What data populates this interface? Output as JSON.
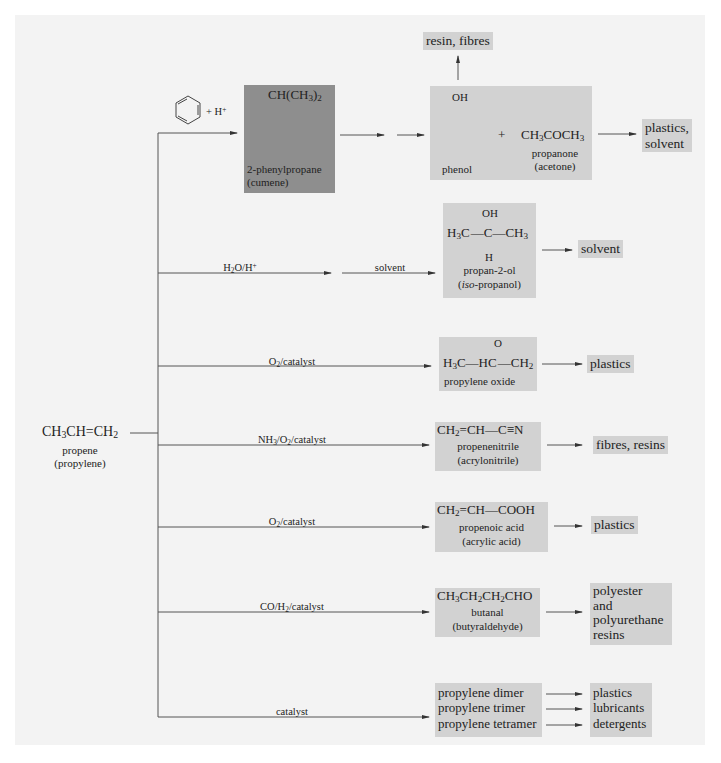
{
  "figure": {
    "start": {
      "formula": "CH3CH=CH2",
      "formula_parts": [
        "CH",
        "3",
        "CH",
        "=",
        "CH",
        "2"
      ],
      "name": "propene",
      "alt_name": "(propylene)"
    },
    "branches": [
      {
        "id": "cumene",
        "reagent": "+ H+",
        "reagent_icon": "benzene-ring-icon",
        "intermediate": {
          "formula": "CH(CH3)2",
          "name": "2-phenylpropane",
          "alt_name": "(cumene)"
        },
        "products": [
          {
            "formula": "OH",
            "name": "phenol"
          },
          {
            "formula": "CH3COCH3",
            "name": "propanone",
            "alt_name": "(acetone)"
          }
        ],
        "plus": "+",
        "uses": [
          "resin, fibres",
          "plastics, solvent"
        ],
        "uses_display": {
          "up": "resin, fibres",
          "right_line1": "plastics,",
          "right_line2": "solvent"
        }
      },
      {
        "id": "isopropanol",
        "condition": "H2O/H+",
        "condition2": "solvent",
        "product": {
          "top": "OH",
          "middle_left": "H3C",
          "middle_center": "C",
          "middle_right": "CH3",
          "bottom": "H",
          "name": "propan-2-ol",
          "alt_name_prefix": "iso",
          "alt_name_suffix": "-propanol"
        },
        "uses": [
          "solvent"
        ]
      },
      {
        "id": "propylene-oxide",
        "condition": "O2/catalyst",
        "product": {
          "top": "O",
          "left": "H3C",
          "mid": "HC",
          "right": "CH2",
          "name": "propylene oxide"
        },
        "uses": [
          "plastics"
        ]
      },
      {
        "id": "acrylonitrile",
        "condition": "NH3/O2/catalyst",
        "product": {
          "formula": "CH2=CH-C≡N",
          "name": "propenenitrile",
          "alt_name": "(acrylonitrile)"
        },
        "uses": [
          "fibres, resins"
        ]
      },
      {
        "id": "acrylic-acid",
        "condition": "O2/catalyst",
        "product": {
          "formula": "CH2=CH-COOH",
          "name": "propenoic acid",
          "alt_name": "(acrylic acid)"
        },
        "uses": [
          "plastics"
        ]
      },
      {
        "id": "butanal",
        "condition": "CO/H2/catalyst",
        "product": {
          "formula": "CH3CH2CH2CHO",
          "name": "butanal",
          "alt_name": "(butyraldehyde)"
        },
        "uses": [
          "polyester",
          "and",
          "polyurethane",
          "resins"
        ]
      },
      {
        "id": "oligomers",
        "condition": "catalyst",
        "products": [
          "propylene dimer",
          "propylene trimer",
          "propylene tetramer"
        ],
        "uses": [
          "plastics",
          "lubricants",
          "detergents"
        ]
      }
    ]
  },
  "colors": {
    "page_background": "#ffffff",
    "panel_background": "#f3f3f3",
    "box_fill": "#d2d2d2",
    "dark_box_fill": "#8e8e8e",
    "line": "#555555",
    "text": "#222222"
  }
}
